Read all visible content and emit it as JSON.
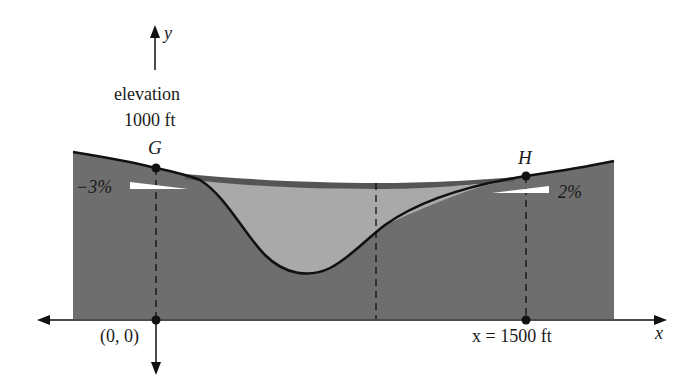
{
  "diagram": {
    "type": "road-profile-cross-section",
    "colors": {
      "ground": "#6e6e6e",
      "fill_region": "#a9a9a9",
      "road_band": "#555555",
      "line": "#111111",
      "grade_marker": "#ffffff",
      "background": "#ffffff"
    },
    "axes": {
      "y_label": "y",
      "x_label": "x"
    },
    "labels": {
      "elevation_line1": "elevation",
      "elevation_line2": "1000 ft",
      "point_g": "G",
      "point_h": "H",
      "grade_left": "−3%",
      "grade_right": "2%",
      "origin": "(0, 0)",
      "x_end": "x = 1500 ft"
    },
    "points": [
      {
        "name": "G",
        "x_ft": 0,
        "grade": "-3%"
      },
      {
        "name": "H",
        "x_ft": 1500,
        "grade": "2%"
      }
    ]
  }
}
